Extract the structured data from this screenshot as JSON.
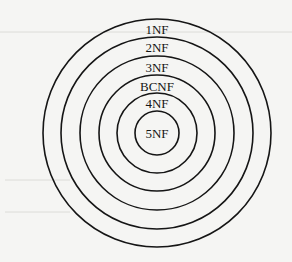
{
  "diagram": {
    "type": "concentric-circles",
    "center": {
      "x": 157,
      "y": 133
    },
    "stroke_color": "#151515",
    "background_color": "#f5f5f3",
    "rings": [
      {
        "label": "1NF",
        "radius": 114,
        "label_y": 29
      },
      {
        "label": "2NF",
        "radius": 96,
        "label_y": 47
      },
      {
        "label": "3NF",
        "radius": 77,
        "label_y": 67
      },
      {
        "label": "BCNF",
        "radius": 58,
        "label_y": 86
      },
      {
        "label": "4NF",
        "radius": 40,
        "label_y": 103
      },
      {
        "label": "5NF",
        "radius": 22,
        "label_y": 133
      }
    ]
  }
}
